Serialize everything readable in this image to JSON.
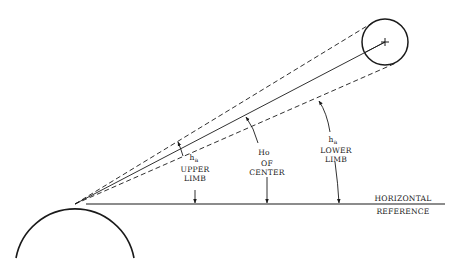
{
  "diagram": {
    "type": "celestial-altitude-geometry",
    "labels": {
      "upper_limb": {
        "symbol": "h",
        "subscript": "a",
        "line1": "UPPER",
        "line2": "LIMB"
      },
      "center": {
        "symbol": "Ho",
        "line1": "OF",
        "line2": "CENTER"
      },
      "lower_limb": {
        "symbol": "h",
        "subscript": "a",
        "line1": "LOWER",
        "line2": "LIMB"
      },
      "horizontal_reference": {
        "line1": "HORIZONTAL",
        "line2": "REFERENCE"
      }
    },
    "elements": [
      "earth-arc",
      "horizontal-reference-line",
      "line-of-sight-center",
      "line-of-sight-upper-limb-dashed",
      "line-of-sight-lower-limb-dashed",
      "celestial-body-circle",
      "center-cross-mark"
    ],
    "colors": {
      "ink": "#1a1a1a",
      "background": "#ffffff"
    }
  }
}
